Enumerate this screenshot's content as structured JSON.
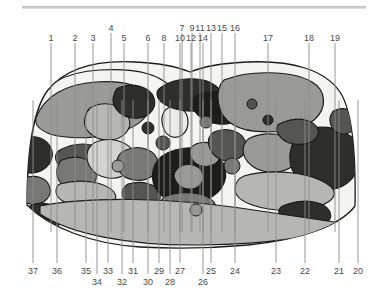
{
  "figure": {
    "type": "anatomical-cross-section",
    "width": 380,
    "height": 296,
    "background": "#ffffff",
    "outline_color": "#1a1a1a",
    "leader_line_color": "#8c8c8c",
    "label_color": "#4a4a4a",
    "top_rule_color": "#c4c4c4",
    "tissue_tones": {
      "background_field": "#f4f4f2",
      "very_light": "#ebebe9",
      "light": "#d2d2d0",
      "mid_light": "#b6b6b4",
      "mid": "#9a9a98",
      "mid_dark": "#787876",
      "dark": "#555553",
      "very_dark": "#2e2e2c",
      "near_black": "#1d1d1b"
    }
  },
  "labels_top": [
    {
      "id": "1",
      "text": "1",
      "x": 51,
      "y": 34,
      "tick_from": 43,
      "tick_to": 72,
      "line_to_y": 232
    },
    {
      "id": "2",
      "text": "2",
      "x": 75,
      "y": 34,
      "tick_from": 43,
      "tick_to": 72,
      "line_to_y": 232
    },
    {
      "id": "3",
      "text": "3",
      "x": 93,
      "y": 34,
      "tick_from": 43,
      "tick_to": 72,
      "line_to_y": 232
    },
    {
      "id": "4",
      "text": "4",
      "x": 111,
      "y": 24,
      "tick_from": 33,
      "tick_to": 72,
      "line_to_y": 232
    },
    {
      "id": "5",
      "text": "5",
      "x": 124,
      "y": 34,
      "tick_from": 43,
      "tick_to": 72,
      "line_to_y": 232
    },
    {
      "id": "6",
      "text": "6",
      "x": 148,
      "y": 34,
      "tick_from": 43,
      "tick_to": 72,
      "line_to_y": 232
    },
    {
      "id": "7",
      "text": "7",
      "x": 182,
      "y": 24,
      "tick_from": 33,
      "tick_to": 72,
      "line_to_y": 232
    },
    {
      "id": "8",
      "text": "8",
      "x": 164,
      "y": 34,
      "tick_from": 43,
      "tick_to": 72,
      "line_to_y": 232
    },
    {
      "id": "9",
      "text": "9",
      "x": 192,
      "y": 24,
      "tick_from": 33,
      "tick_to": 72,
      "line_to_y": 232
    },
    {
      "id": "10",
      "text": "10",
      "x": 180,
      "y": 34,
      "tick_from": 43,
      "tick_to": 72,
      "line_to_y": 232
    },
    {
      "id": "11",
      "text": "11",
      "x": 200,
      "y": 24,
      "tick_from": 33,
      "tick_to": 72,
      "line_to_y": 232
    },
    {
      "id": "12",
      "text": "12",
      "x": 191,
      "y": 34,
      "tick_from": 43,
      "tick_to": 72,
      "line_to_y": 232
    },
    {
      "id": "13",
      "text": "13",
      "x": 211,
      "y": 24,
      "tick_from": 33,
      "tick_to": 72,
      "line_to_y": 232
    },
    {
      "id": "14",
      "text": "14",
      "x": 203,
      "y": 34,
      "tick_from": 43,
      "tick_to": 72,
      "line_to_y": 232
    },
    {
      "id": "15",
      "text": "15",
      "x": 222,
      "y": 24,
      "tick_from": 33,
      "tick_to": 72,
      "line_to_y": 232
    },
    {
      "id": "16",
      "text": "16",
      "x": 235,
      "y": 24,
      "tick_from": 33,
      "tick_to": 72,
      "line_to_y": 232
    },
    {
      "id": "17",
      "text": "17",
      "x": 268,
      "y": 34,
      "tick_from": 43,
      "tick_to": 72,
      "line_to_y": 232
    },
    {
      "id": "18",
      "text": "18",
      "x": 309,
      "y": 34,
      "tick_from": 43,
      "tick_to": 72,
      "line_to_y": 232
    },
    {
      "id": "19",
      "text": "19",
      "x": 335,
      "y": 34,
      "tick_from": 43,
      "tick_to": 72,
      "line_to_y": 232
    }
  ],
  "labels_bottom": [
    {
      "id": "20",
      "text": "20",
      "x": 358,
      "y": 267,
      "tick_from": 263,
      "tick_to": 243,
      "line_to_y": 100
    },
    {
      "id": "21",
      "text": "21",
      "x": 339,
      "y": 267,
      "tick_from": 263,
      "tick_to": 243,
      "line_to_y": 100
    },
    {
      "id": "22",
      "text": "22",
      "x": 305,
      "y": 267,
      "tick_from": 263,
      "tick_to": 243,
      "line_to_y": 100
    },
    {
      "id": "23",
      "text": "23",
      "x": 276,
      "y": 267,
      "tick_from": 263,
      "tick_to": 243,
      "line_to_y": 100
    },
    {
      "id": "24",
      "text": "24",
      "x": 235,
      "y": 267,
      "tick_from": 263,
      "tick_to": 243,
      "line_to_y": 100
    },
    {
      "id": "25",
      "text": "25",
      "x": 211,
      "y": 267,
      "tick_from": 263,
      "tick_to": 243,
      "line_to_y": 100
    },
    {
      "id": "26",
      "text": "26",
      "x": 203,
      "y": 278,
      "tick_from": 274,
      "tick_to": 243,
      "line_to_y": 100
    },
    {
      "id": "27",
      "text": "27",
      "x": 180,
      "y": 267,
      "tick_from": 263,
      "tick_to": 243,
      "line_to_y": 100
    },
    {
      "id": "28",
      "text": "28",
      "x": 170,
      "y": 278,
      "tick_from": 274,
      "tick_to": 243,
      "line_to_y": 100
    },
    {
      "id": "29",
      "text": "29",
      "x": 159,
      "y": 267,
      "tick_from": 263,
      "tick_to": 243,
      "line_to_y": 100
    },
    {
      "id": "30",
      "text": "30",
      "x": 148,
      "y": 278,
      "tick_from": 274,
      "tick_to": 243,
      "line_to_y": 100
    },
    {
      "id": "31",
      "text": "31",
      "x": 133,
      "y": 267,
      "tick_from": 263,
      "tick_to": 243,
      "line_to_y": 100
    },
    {
      "id": "32",
      "text": "32",
      "x": 122,
      "y": 278,
      "tick_from": 274,
      "tick_to": 243,
      "line_to_y": 100
    },
    {
      "id": "33",
      "text": "33",
      "x": 108,
      "y": 267,
      "tick_from": 263,
      "tick_to": 243,
      "line_to_y": 100
    },
    {
      "id": "34",
      "text": "34",
      "x": 97,
      "y": 278,
      "tick_from": 274,
      "tick_to": 243,
      "line_to_y": 100
    },
    {
      "id": "35",
      "text": "35",
      "x": 86,
      "y": 267,
      "tick_from": 263,
      "tick_to": 243,
      "line_to_y": 100
    },
    {
      "id": "36",
      "text": "36",
      "x": 57,
      "y": 267,
      "tick_from": 263,
      "tick_to": 243,
      "line_to_y": 100
    },
    {
      "id": "37",
      "text": "37",
      "x": 33,
      "y": 267,
      "tick_from": 263,
      "tick_to": 243,
      "line_to_y": 100
    }
  ]
}
